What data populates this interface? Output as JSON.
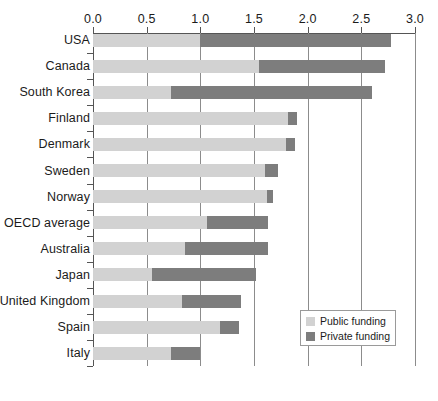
{
  "chart_data": {
    "type": "bar",
    "orientation": "horizontal",
    "stacked": true,
    "title": "",
    "subtitle": "",
    "xlabel": "",
    "ylabel": "",
    "xlim": [
      0.0,
      3.0
    ],
    "xticks": [
      "0.0",
      "0.5",
      "1.0",
      "1.5",
      "2.0",
      "2.5",
      "3.0"
    ],
    "xtick_values": [
      0.0,
      0.5,
      1.0,
      1.5,
      2.0,
      2.5,
      3.0
    ],
    "grid": "vertical",
    "axis_position": "top",
    "legend_position": "bottom-right",
    "categories": [
      "USA",
      "Canada",
      "South Korea",
      "Finland",
      "Denmark",
      "Sweden",
      "Norway",
      "OECD average",
      "Australia",
      "Japan",
      "United Kingdom",
      "Spain",
      "Italy"
    ],
    "series": [
      {
        "name": "Public funding",
        "color": "#d2d2d2",
        "values": [
          1.0,
          1.55,
          0.73,
          1.82,
          1.8,
          1.6,
          1.62,
          1.06,
          0.86,
          0.55,
          0.83,
          1.18,
          0.73
        ]
      },
      {
        "name": "Private funding",
        "color": "#7d7d7d",
        "values": [
          1.78,
          1.17,
          1.87,
          0.08,
          0.08,
          0.12,
          0.06,
          0.57,
          0.77,
          0.97,
          0.55,
          0.18,
          0.27
        ]
      }
    ],
    "totals": [
      2.78,
      2.72,
      2.6,
      1.9,
      1.88,
      1.72,
      1.68,
      1.63,
      1.63,
      1.52,
      1.38,
      1.36,
      1.0
    ]
  },
  "legend": {
    "items": [
      {
        "label": "Public funding",
        "color": "#d2d2d2"
      },
      {
        "label": "Private funding",
        "color": "#7d7d7d"
      }
    ]
  }
}
